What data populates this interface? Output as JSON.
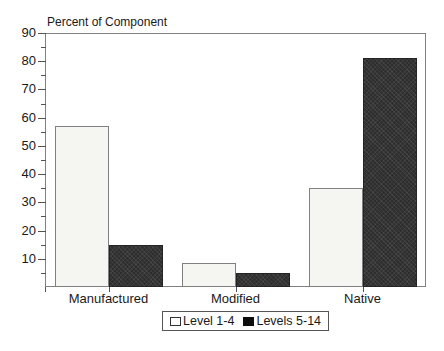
{
  "title": "Percent of Component",
  "colors": {
    "background": "#ffffff",
    "axis": "#808080",
    "tick": "#555555",
    "text": "#1a1a1a",
    "bar_level_1_4": "#f5f5f2",
    "bar_levels_5_14": "#2e2e2e"
  },
  "chart_data": {
    "type": "bar",
    "title": "Percent of Component",
    "categories": [
      "Manufactured",
      "Modified",
      "Native"
    ],
    "series": [
      {
        "name": "Level 1-4",
        "values": [
          57,
          8.5,
          35
        ],
        "style": "light"
      },
      {
        "name": "Levels 5-14",
        "values": [
          15,
          5,
          81
        ],
        "style": "dark"
      }
    ],
    "xlabel": "",
    "ylabel": "Percent of Component",
    "ylim": [
      0,
      90
    ],
    "y_major_tick_step": 10,
    "y_minor_tick_step": 5,
    "grid": false,
    "legend_position": "bottom-center"
  },
  "legend": {
    "items": [
      {
        "label": "Level 1-4",
        "swatch": "light"
      },
      {
        "label": "Levels 5-14",
        "swatch": "dark"
      }
    ]
  }
}
